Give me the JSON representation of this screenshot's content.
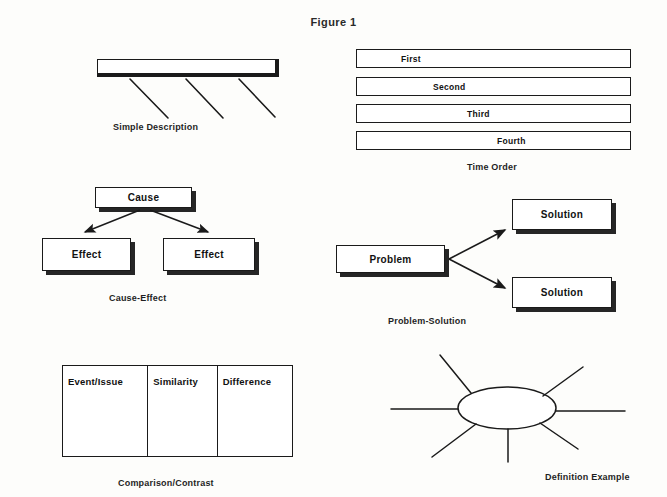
{
  "figure": {
    "title": "Figure 1"
  },
  "panels": {
    "simple_description": {
      "caption": "Simple Description",
      "bar": {
        "x": 97,
        "y": 59,
        "w": 182,
        "h": 18
      },
      "spokes": [
        {
          "x1": 130,
          "y1": 79,
          "x2": 168,
          "y2": 118
        },
        {
          "x1": 186,
          "y1": 79,
          "x2": 223,
          "y2": 118
        },
        {
          "x1": 239,
          "y1": 79,
          "x2": 275,
          "y2": 117
        }
      ]
    },
    "time_order": {
      "caption": "Time Order",
      "bars": [
        {
          "label": "First",
          "x": 356,
          "y": 49,
          "w": 275,
          "h": 19,
          "pad": 44
        },
        {
          "label": "Second",
          "x": 356,
          "y": 77,
          "w": 275,
          "h": 19,
          "pad": 76
        },
        {
          "label": "Third",
          "x": 356,
          "y": 104,
          "w": 275,
          "h": 19,
          "pad": 110
        },
        {
          "label": "Fourth",
          "x": 356,
          "y": 131,
          "w": 275,
          "h": 19,
          "pad": 140
        }
      ]
    },
    "cause_effect": {
      "caption": "Cause-Effect",
      "cause": {
        "label": "Cause",
        "x": 95,
        "y": 187,
        "w": 97,
        "h": 21
      },
      "effects": [
        {
          "label": "Effect",
          "x": 42,
          "y": 238,
          "w": 89,
          "h": 33
        },
        {
          "label": "Effect",
          "x": 163,
          "y": 238,
          "w": 92,
          "h": 33
        }
      ],
      "arrows": [
        {
          "x1": 140,
          "y1": 210,
          "x2": 83,
          "y2": 234
        },
        {
          "x1": 150,
          "y1": 210,
          "x2": 210,
          "y2": 234
        }
      ]
    },
    "problem_solution": {
      "caption": "Problem-Solution",
      "problem": {
        "label": "Problem",
        "x": 336,
        "y": 245,
        "w": 109,
        "h": 28
      },
      "solutions": [
        {
          "label": "Solution",
          "x": 512,
          "y": 199,
          "w": 100,
          "h": 31
        },
        {
          "label": "Solution",
          "x": 512,
          "y": 277,
          "w": 100,
          "h": 31
        }
      ],
      "arrows": [
        {
          "x1": 449,
          "y1": 259,
          "x2": 507,
          "y2": 228
        },
        {
          "x1": 449,
          "y1": 259,
          "x2": 507,
          "y2": 290
        }
      ]
    },
    "comparison_contrast": {
      "caption": "Comparison/Contrast",
      "table": {
        "x": 62,
        "y": 365,
        "w": 231,
        "h": 92
      },
      "columns": [
        {
          "header": "Event/Issue",
          "w": 86
        },
        {
          "header": "Similarity",
          "w": 70
        },
        {
          "header": "Difference",
          "w": 75
        }
      ]
    },
    "definition_example": {
      "caption": "Definition Example",
      "ellipse": {
        "cx": 507,
        "cy": 408,
        "rx": 49,
        "ry": 21
      },
      "spokes": [
        {
          "x1": 471,
          "y1": 393,
          "x2": 440,
          "y2": 355
        },
        {
          "x1": 543,
          "y1": 396,
          "x2": 583,
          "y2": 367
        },
        {
          "x1": 458,
          "y1": 409,
          "x2": 391,
          "y2": 409
        },
        {
          "x1": 556,
          "y1": 411,
          "x2": 625,
          "y2": 411
        },
        {
          "x1": 476,
          "y1": 424,
          "x2": 432,
          "y2": 457
        },
        {
          "x1": 540,
          "y1": 423,
          "x2": 578,
          "y2": 449
        },
        {
          "x1": 508,
          "y1": 429,
          "x2": 508,
          "y2": 462
        }
      ]
    }
  },
  "colors": {
    "ink": "#1a1a1a",
    "paper": "#fdfdfb",
    "shadow": "#262626"
  }
}
